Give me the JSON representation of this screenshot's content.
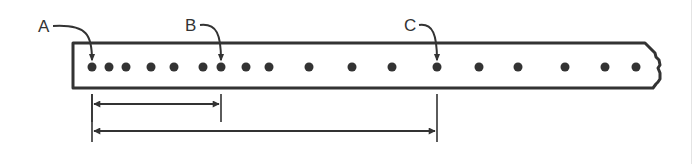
{
  "diagram": {
    "colors": {
      "ink": "#333333",
      "background": "#ffffff"
    },
    "strip": {
      "left": 73,
      "top": 43,
      "bottom": 88,
      "right": 655,
      "right_edge": "torn"
    },
    "holes": {
      "y": 67,
      "radius": 4.5,
      "x": [
        92,
        109,
        126,
        151,
        174,
        203,
        221,
        246,
        269,
        309,
        352,
        392,
        437,
        479,
        518,
        565,
        605,
        636
      ]
    },
    "markers": [
      {
        "label": "A",
        "label_x": 38,
        "label_y": 32,
        "target_x": 92
      },
      {
        "label": "B",
        "label_x": 185,
        "label_y": 31,
        "target_x": 221
      },
      {
        "label": "C",
        "label_x": 404,
        "label_y": 31,
        "target_x": 437
      }
    ],
    "dimensions": [
      {
        "from_label": "A",
        "to_label": "B",
        "x1": 92,
        "x2": 221,
        "y": 104,
        "ext_bottom": 122
      },
      {
        "from_label": "A",
        "to_label": "C",
        "x1": 92,
        "x2": 437,
        "y": 131,
        "ext_bottom": 142
      }
    ]
  }
}
